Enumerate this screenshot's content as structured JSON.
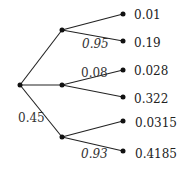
{
  "diagram": {
    "type": "probability-tree",
    "edge_labels": {
      "top_lower": "0.95",
      "mid_upper": "0.08",
      "root_bottom": "0.45",
      "bottom_lower": "0.93"
    },
    "leaves": [
      "0.01",
      "0.19",
      "0.028",
      "0.322",
      "0.0315",
      "0.4185"
    ]
  }
}
